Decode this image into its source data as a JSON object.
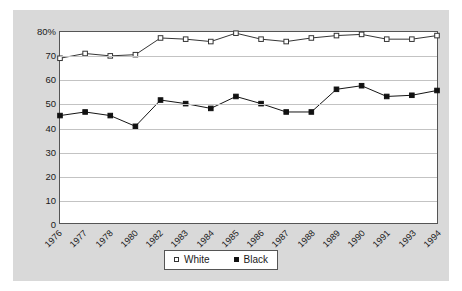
{
  "chart_data": {
    "type": "line",
    "title": "",
    "subtitle": "",
    "xlabel": "",
    "ylabel": "",
    "categories": [
      "1976",
      "1977",
      "1978",
      "1980",
      "1982",
      "1983",
      "1984",
      "1985",
      "1986",
      "1987",
      "1988",
      "1989",
      "1990",
      "1991",
      "1993",
      "1994"
    ],
    "ylim": [
      0,
      80
    ],
    "ytick_labels": [
      "80%",
      "70",
      "60",
      "50",
      "40",
      "30",
      "20",
      "10",
      "0"
    ],
    "ytick_values": [
      80,
      70,
      60,
      50,
      40,
      30,
      20,
      10,
      0
    ],
    "grid": true,
    "grid_axis": "y",
    "legend_position": "bottom",
    "series": [
      {
        "name": "White",
        "marker": "open-square",
        "color": "#333333",
        "values": [
          69,
          71,
          70,
          70.5,
          77.5,
          77,
          76,
          79.5,
          77,
          76,
          77.5,
          78.5,
          79,
          77,
          77,
          78.5
        ]
      },
      {
        "name": "Black",
        "marker": "filled-square",
        "color": "#111111",
        "values": [
          45,
          46.5,
          45,
          40.5,
          51.5,
          50,
          48,
          53,
          50,
          46.5,
          46.5,
          56,
          57.5,
          53,
          53.5,
          55.5
        ]
      }
    ]
  },
  "legend": {
    "entries": [
      {
        "label": "White"
      },
      {
        "label": "Black"
      }
    ]
  },
  "colors": {
    "panel_background": "#d9d9d9",
    "plot_background": "#ffffff",
    "axis": "#555555",
    "gridline": "#c3c3c3",
    "text": "#1a1a1a"
  }
}
